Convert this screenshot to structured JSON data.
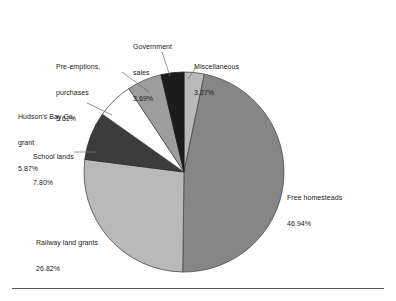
{
  "chart_data": {
    "type": "pie",
    "title": "",
    "subtitle": "",
    "xlabel": "",
    "ylabel": "",
    "legend_position": "none",
    "grid": false,
    "units": "percent",
    "start_angle_deg": 0,
    "direction": "clockwise",
    "categories": [
      "Miscellaneous",
      "Free homesteads",
      "Railway land grants",
      "School lands",
      "Hudson's Bay Co. grant",
      "Pre-emptions, purchases",
      "Government sales"
    ],
    "values": [
      3.27,
      46.94,
      26.82,
      7.8,
      5.87,
      5.62,
      3.69
    ],
    "slices": [
      {
        "name": "Miscellaneous",
        "label_line1": "Miscellaneous",
        "label_line2": "3.27%",
        "value": 3.27,
        "color": "#b9b9b9",
        "stroke": "#4a4a4a"
      },
      {
        "name": "Free homesteads",
        "label_line1": "Free homesteads",
        "label_line2": "46.94%",
        "value": 46.94,
        "color": "#868686",
        "stroke": "#4a4a4a"
      },
      {
        "name": "Railway land grants",
        "label_line1": "Railway land grants",
        "label_line2": "26.82%",
        "value": 26.82,
        "color": "#b9b9b9",
        "stroke": "#4a4a4a"
      },
      {
        "name": "School lands",
        "label_line1": "School lands",
        "label_line2": "7.80%",
        "value": 7.8,
        "color": "#3c3c3c",
        "stroke": "#2a2a2a"
      },
      {
        "name": "Hudson's Bay Co. grant",
        "label_line1": "Hudson's Bay Co.",
        "label_line1b": "grant",
        "label_line2": "5.87%",
        "value": 5.87,
        "color": "#ffffff",
        "stroke": "#4a4a4a"
      },
      {
        "name": "Pre-emptions, purchases",
        "label_line1": "Pre-emptions,",
        "label_line1b": "purchases",
        "label_line2": "5.62%",
        "value": 5.62,
        "color": "#9d9d9d",
        "stroke": "#4a4a4a"
      },
      {
        "name": "Government sales",
        "label_line1": "Government",
        "label_line1b": "sales",
        "label_line2": "3.69%",
        "value": 3.69,
        "color": "#1c1c1c",
        "stroke": "#1c1c1c"
      }
    ]
  },
  "labels": {
    "pre_emptions": {
      "line1": "Pre-emptions,",
      "line2": "purchases",
      "line3": "5.62%"
    },
    "government_sales": {
      "line1": "Government",
      "line2": "sales",
      "line3": "3.69%"
    },
    "miscellaneous": {
      "line1": "Miscellaneous",
      "line2": "3.27%"
    },
    "hudsons_bay": {
      "line1": "Hudson's Bay Co.",
      "line2": "grant",
      "line3": "5.87%"
    },
    "school_lands": {
      "line1": "School lands",
      "line2": "7.80%"
    },
    "railway": {
      "line1": "Railway land grants",
      "line2": "26.82%"
    },
    "free_homesteads": {
      "line1": "Free homesteads",
      "line2": "46.94%"
    }
  },
  "colors": {
    "free_homesteads": "#868686",
    "railway": "#b9b9b9",
    "school_lands": "#3c3c3c",
    "hudsons_bay": "#ffffff",
    "pre_emptions": "#9d9d9d",
    "government_sales": "#1c1c1c",
    "miscellaneous": "#b9b9b9",
    "leader_line": "#6a6a6a",
    "rule": "#555555",
    "text": "#1a1a1a",
    "background": "#ffffff"
  },
  "geometry": {
    "center_x": 184,
    "center_y": 172,
    "radius": 100
  }
}
